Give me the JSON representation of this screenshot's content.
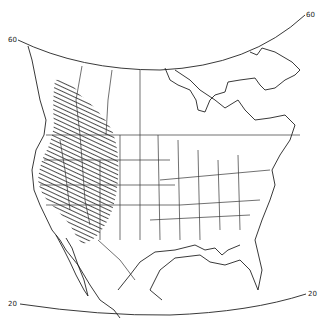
{
  "map": {
    "type": "range-map",
    "region": "North America",
    "projection": "conic",
    "latitude_lines": [
      {
        "value": "60",
        "label_left": "60",
        "label_right": "60"
      },
      {
        "value": "20",
        "label_left": "20",
        "label_right": "20"
      }
    ],
    "shaded_region": {
      "description": "hatched range area in western North America",
      "pattern": "diagonal-hatch",
      "color": "#222222"
    },
    "colors": {
      "background": "#ffffff",
      "lines": "#222222"
    }
  }
}
